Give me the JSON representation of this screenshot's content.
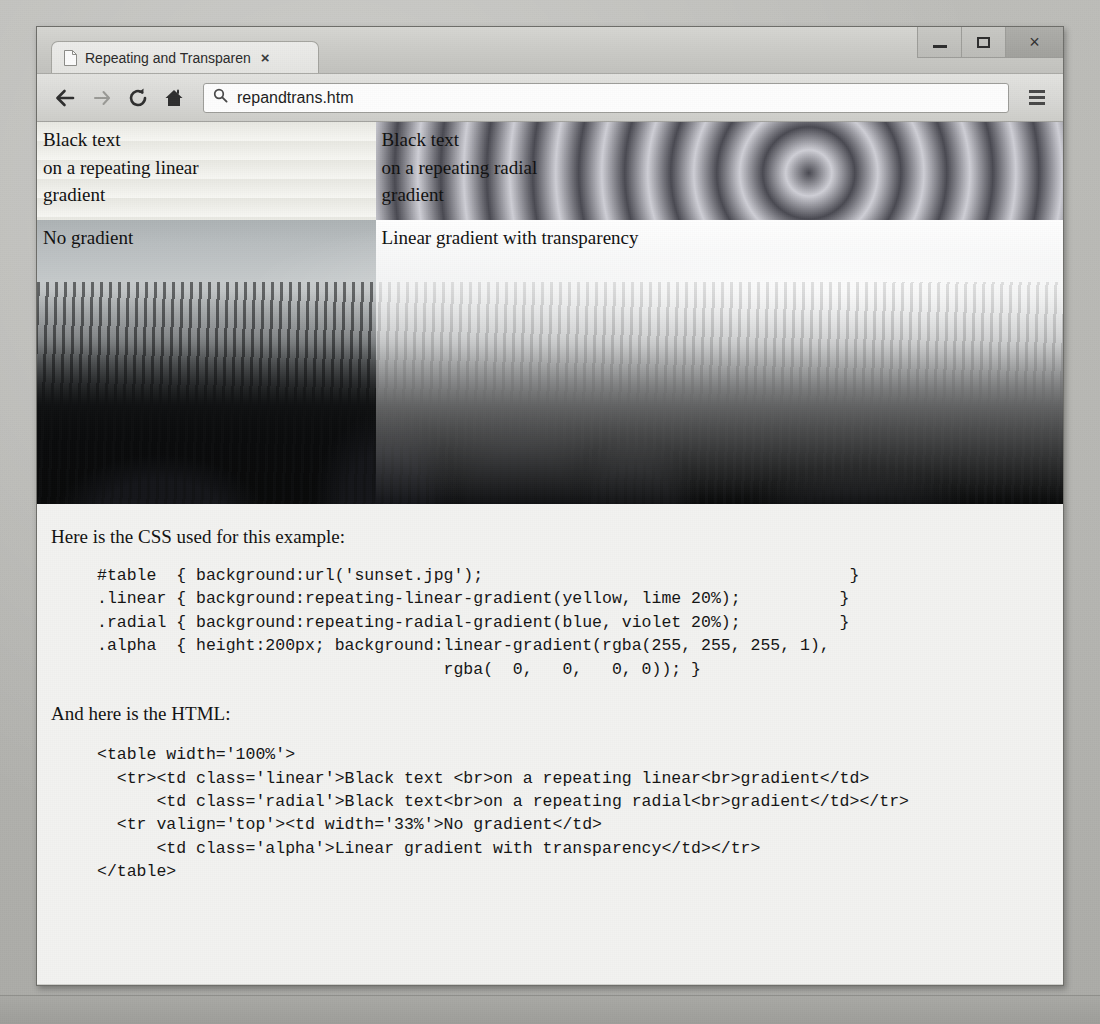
{
  "window": {
    "controls": [
      {
        "name": "minimize",
        "glyph": "minimize-icon"
      },
      {
        "name": "maximize",
        "glyph": "maximize-icon"
      },
      {
        "name": "close",
        "label": "×"
      }
    ]
  },
  "tab": {
    "title": "Repeating and Transparen",
    "close_label": "×",
    "favicon": "page-icon",
    "new_tab_label": ""
  },
  "toolbar": {
    "back_label": "←",
    "forward_label": "→",
    "reload_label": "⟳",
    "home_label": "⌂",
    "search_icon": "search-icon",
    "url": "repandtrans.htm",
    "url_placeholder": "Search or type URL",
    "menu_label": "menu-icon"
  },
  "table": {
    "cells": {
      "linear": [
        "Black text",
        "on a repeating linear",
        "gradient"
      ],
      "radial": [
        "Black text",
        "on a repeating radial",
        "gradient"
      ],
      "nogradient": "No gradient",
      "alpha": "Linear gradient with transparency"
    }
  },
  "content": {
    "css_intro": "Here is the CSS used for this example:",
    "css_code": "#table  { background:url('sunset.jpg');                                     }\n.linear { background:repeating-linear-gradient(yellow, lime 20%);          }\n.radial { background:repeating-radial-gradient(blue, violet 20%);          }\n.alpha  { height:200px; background:linear-gradient(rgba(255, 255, 255, 1),\n                                   rgba(  0,   0,   0, 0)); }",
    "html_intro": "And here is the HTML:",
    "html_code": "<table width='100%'>\n  <tr><td class='linear'>Black text <br>on a repeating linear<br>gradient</td>\n      <td class='radial'>Black text<br>on a repeating radial<br>gradient</td></tr>\n  <tr valign='top'><td width='33%'>No gradient</td>\n      <td class='alpha'>Linear gradient with transparency</td></tr>\n</table>"
  },
  "colors": {
    "page_background": "#b6b6b2",
    "window_chrome": "#cfcfcb",
    "viewport_background": "#f2f2f0",
    "text": "#121212"
  }
}
